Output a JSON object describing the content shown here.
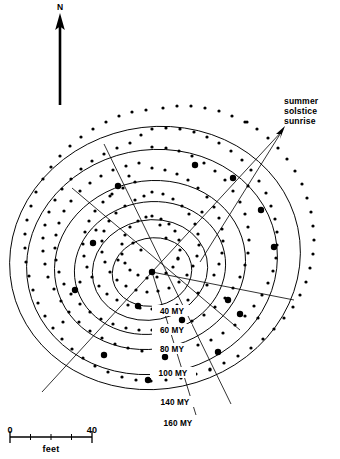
{
  "figure": {
    "background_color": "#ffffff",
    "ink_color": "#000000",
    "width": 340,
    "height": 459
  },
  "north_arrow": {
    "label": "N",
    "icon": "north-arrow-icon",
    "direction": "up",
    "tail": {
      "x": 60,
      "y": 105
    },
    "head": {
      "x": 60,
      "y": 18
    }
  },
  "annotation": {
    "icon": "arrow-pointer-icon",
    "lines": [
      "summer",
      "solstice",
      "sunrise"
    ],
    "line1": "summer",
    "line2": "solstice",
    "line3": "sunrise",
    "leader": {
      "x1": 285,
      "y1": 128,
      "x2": 197,
      "y2": 268
    }
  },
  "scale_bar": {
    "start_label": "0",
    "end_label": "40",
    "unit_label": "feet",
    "x1": 10,
    "x2": 92,
    "y": 437,
    "ticks": [
      10,
      30.5,
      51,
      71.5,
      92
    ]
  },
  "chart_data": {
    "type": "scatter",
    "xlabel": "",
    "ylabel": "",
    "center": {
      "x": 152,
      "y": 272
    },
    "ring_labels": [
      "40 MY",
      "60 MY",
      "80 MY",
      "100 MY",
      "140 MY",
      "160 MY"
    ],
    "ring_values": [
      40,
      60,
      80,
      100,
      140,
      160
    ],
    "ring_unit": "MY",
    "rings": [
      {
        "label": "40 MY",
        "value": 40,
        "rx": 40,
        "ry": 34,
        "cx": 152,
        "cy": 272,
        "rot": -12,
        "label_x": 172,
        "label_y": 313
      },
      {
        "label": "60 MY",
        "value": 60,
        "rx": 58,
        "ry": 50,
        "cx": 150,
        "cy": 270,
        "rot": -12,
        "label_x": 172,
        "label_y": 332
      },
      {
        "label": "80 MY",
        "value": 80,
        "rx": 76,
        "ry": 66,
        "cx": 150,
        "cy": 268,
        "rot": -12,
        "label_x": 172,
        "label_y": 351
      },
      {
        "label": "100 MY",
        "value": 100,
        "rx": 96,
        "ry": 84,
        "cx": 150,
        "cy": 265,
        "rot": -12,
        "label_x": 172,
        "label_y": 375
      },
      {
        "label": "140 MY",
        "value": 140,
        "rx": 126,
        "ry": 112,
        "cx": 152,
        "cy": 262,
        "rot": -12,
        "label_x": 175,
        "label_y": 404
      },
      {
        "label": "160 MY",
        "value": 160,
        "rx": 146,
        "ry": 131,
        "cx": 155,
        "cy": 258,
        "rot": -12,
        "label_x": 178,
        "label_y": 425
      }
    ],
    "alignment_lines": [
      {
        "name": "summer-solstice-sunrise",
        "x1": 152,
        "y1": 272,
        "x2": 283,
        "y2": 130
      },
      {
        "name": "solstice-back-sight",
        "x1": 152,
        "y1": 272,
        "x2": 42,
        "y2": 392
      },
      {
        "name": "cross-alignment-nw-se",
        "x1": 104,
        "y1": 144,
        "x2": 231,
        "y2": 404
      },
      {
        "name": "cross-alignment-ne-sw",
        "x1": 240,
        "y1": 330,
        "x2": 72,
        "y2": 188
      },
      {
        "name": "radial-alignment-east",
        "x1": 152,
        "y1": 272,
        "x2": 294,
        "y2": 300
      },
      {
        "name": "radial-alignment-ssw",
        "x1": 152,
        "y1": 272,
        "x2": 196,
        "y2": 415
      }
    ],
    "stones_small": [
      [
        163,
        108
      ],
      [
        177,
        106
      ],
      [
        191,
        106
      ],
      [
        205,
        108
      ],
      [
        219,
        111
      ],
      [
        232,
        116
      ],
      [
        245,
        122
      ],
      [
        257,
        129
      ],
      [
        268,
        138
      ],
      [
        278,
        148
      ],
      [
        287,
        159
      ],
      [
        295,
        171
      ],
      [
        302,
        184
      ],
      [
        307,
        198
      ],
      [
        311,
        212
      ],
      [
        313,
        226
      ],
      [
        314,
        240
      ],
      [
        313,
        254
      ],
      [
        310,
        268
      ],
      [
        306,
        282
      ],
      [
        300,
        295
      ],
      [
        293,
        307
      ],
      [
        284,
        318
      ],
      [
        274,
        329
      ],
      [
        263,
        339
      ],
      [
        251,
        348
      ],
      [
        238,
        356
      ],
      [
        224,
        363
      ],
      [
        210,
        369
      ],
      [
        196,
        374
      ],
      [
        181,
        378
      ],
      [
        166,
        380
      ],
      [
        151,
        381
      ],
      [
        136,
        380
      ],
      [
        122,
        377
      ],
      [
        108,
        372
      ],
      [
        95,
        366
      ],
      [
        83,
        358
      ],
      [
        72,
        349
      ],
      [
        62,
        339
      ],
      [
        53,
        328
      ],
      [
        45,
        316
      ],
      [
        38,
        303
      ],
      [
        33,
        290
      ],
      [
        29,
        276
      ],
      [
        26,
        262
      ],
      [
        25,
        248
      ],
      [
        25,
        234
      ],
      [
        27,
        220
      ],
      [
        31,
        206
      ],
      [
        36,
        192
      ],
      [
        43,
        179
      ],
      [
        51,
        167
      ],
      [
        60,
        156
      ],
      [
        70,
        146
      ],
      [
        81,
        137
      ],
      [
        93,
        129
      ],
      [
        106,
        122
      ],
      [
        119,
        116
      ],
      [
        132,
        112
      ],
      [
        146,
        110
      ],
      [
        152,
        129
      ],
      [
        166,
        128
      ],
      [
        180,
        129
      ],
      [
        194,
        132
      ],
      [
        207,
        137
      ],
      [
        219,
        143
      ],
      [
        231,
        151
      ],
      [
        242,
        160
      ],
      [
        251,
        170
      ],
      [
        259,
        181
      ],
      [
        266,
        193
      ],
      [
        271,
        206
      ],
      [
        275,
        219
      ],
      [
        277,
        232
      ],
      [
        277,
        245
      ],
      [
        276,
        258
      ],
      [
        273,
        271
      ],
      [
        268,
        283
      ],
      [
        262,
        295
      ],
      [
        254,
        306
      ],
      [
        245,
        316
      ],
      [
        235,
        325
      ],
      [
        223,
        333
      ],
      [
        211,
        340
      ],
      [
        198,
        345
      ],
      [
        184,
        349
      ],
      [
        170,
        351
      ],
      [
        156,
        352
      ],
      [
        142,
        351
      ],
      [
        128,
        348
      ],
      [
        115,
        344
      ],
      [
        102,
        338
      ],
      [
        90,
        331
      ],
      [
        79,
        322
      ],
      [
        69,
        312
      ],
      [
        61,
        301
      ],
      [
        54,
        289
      ],
      [
        48,
        277
      ],
      [
        45,
        264
      ],
      [
        43,
        251
      ],
      [
        43,
        238
      ],
      [
        45,
        225
      ],
      [
        49,
        212
      ],
      [
        55,
        200
      ],
      [
        62,
        189
      ],
      [
        71,
        179
      ],
      [
        81,
        169
      ],
      [
        92,
        161
      ],
      [
        104,
        154
      ],
      [
        117,
        148
      ],
      [
        130,
        143
      ],
      [
        141,
        135
      ],
      [
        152,
        147
      ],
      [
        166,
        148
      ],
      [
        179,
        151
      ],
      [
        192,
        156
      ],
      [
        204,
        163
      ],
      [
        215,
        171
      ],
      [
        225,
        180
      ],
      [
        233,
        191
      ],
      [
        240,
        202
      ],
      [
        245,
        214
      ],
      [
        248,
        227
      ],
      [
        249,
        240
      ],
      [
        248,
        253
      ],
      [
        245,
        265
      ],
      [
        240,
        277
      ],
      [
        233,
        288
      ],
      [
        225,
        298
      ],
      [
        215,
        307
      ],
      [
        204,
        315
      ],
      [
        192,
        321
      ],
      [
        179,
        326
      ],
      [
        166,
        329
      ],
      [
        152,
        330
      ],
      [
        139,
        330
      ],
      [
        126,
        328
      ],
      [
        113,
        324
      ],
      [
        101,
        319
      ],
      [
        90,
        312
      ],
      [
        80,
        304
      ],
      [
        71,
        294
      ],
      [
        64,
        284
      ],
      [
        59,
        272
      ],
      [
        56,
        260
      ],
      [
        55,
        248
      ],
      [
        56,
        235
      ],
      [
        59,
        223
      ],
      [
        64,
        211
      ],
      [
        71,
        201
      ],
      [
        80,
        191
      ],
      [
        90,
        183
      ],
      [
        101,
        176
      ],
      [
        113,
        170
      ],
      [
        126,
        166
      ],
      [
        139,
        163
      ],
      [
        152,
        168
      ],
      [
        165,
        170
      ],
      [
        177,
        174
      ],
      [
        188,
        180
      ],
      [
        198,
        188
      ],
      [
        207,
        197
      ],
      [
        214,
        207
      ],
      [
        219,
        218
      ],
      [
        222,
        229
      ],
      [
        223,
        241
      ],
      [
        222,
        253
      ],
      [
        219,
        264
      ],
      [
        214,
        275
      ],
      [
        207,
        285
      ],
      [
        198,
        293
      ],
      [
        188,
        300
      ],
      [
        177,
        305
      ],
      [
        165,
        308
      ],
      [
        152,
        309
      ],
      [
        140,
        308
      ],
      [
        128,
        305
      ],
      [
        117,
        300
      ],
      [
        107,
        294
      ],
      [
        99,
        286
      ],
      [
        92,
        277
      ],
      [
        87,
        267
      ],
      [
        84,
        256
      ],
      [
        83,
        244
      ],
      [
        85,
        232
      ],
      [
        89,
        221
      ],
      [
        95,
        211
      ],
      [
        103,
        202
      ],
      [
        112,
        194
      ],
      [
        123,
        188
      ],
      [
        135,
        182
      ],
      [
        152,
        192
      ],
      [
        163,
        194
      ],
      [
        173,
        199
      ],
      [
        182,
        206
      ],
      [
        189,
        214
      ],
      [
        195,
        224
      ],
      [
        198,
        234
      ],
      [
        199,
        245
      ],
      [
        197,
        256
      ],
      [
        193,
        266
      ],
      [
        187,
        275
      ],
      [
        179,
        282
      ],
      [
        169,
        288
      ],
      [
        158,
        291
      ],
      [
        147,
        292
      ],
      [
        136,
        290
      ],
      [
        126,
        286
      ],
      [
        117,
        280
      ],
      [
        110,
        272
      ],
      [
        105,
        262
      ],
      [
        102,
        252
      ],
      [
        102,
        241
      ],
      [
        104,
        231
      ],
      [
        109,
        221
      ],
      [
        116,
        213
      ],
      [
        125,
        206
      ],
      [
        135,
        200
      ],
      [
        144,
        196
      ],
      [
        152,
        216
      ],
      [
        161,
        219
      ],
      [
        169,
        224
      ],
      [
        175,
        231
      ],
      [
        179,
        240
      ],
      [
        180,
        250
      ],
      [
        178,
        259
      ],
      [
        173,
        267
      ],
      [
        166,
        273
      ],
      [
        157,
        277
      ],
      [
        147,
        278
      ],
      [
        138,
        275
      ],
      [
        130,
        270
      ],
      [
        125,
        263
      ],
      [
        122,
        254
      ],
      [
        122,
        244
      ],
      [
        125,
        235
      ],
      [
        130,
        227
      ],
      [
        138,
        221
      ],
      [
        146,
        217
      ],
      [
        110,
        196
      ],
      [
        129,
        176
      ],
      [
        141,
        250
      ],
      [
        166,
        238
      ],
      [
        178,
        258
      ],
      [
        133,
        243
      ],
      [
        118,
        260
      ],
      [
        160,
        225
      ],
      [
        96,
        230
      ],
      [
        202,
        212
      ],
      [
        248,
        186
      ],
      [
        80,
        282
      ],
      [
        210,
        370
      ],
      [
        258,
        318
      ],
      [
        63,
        322
      ],
      [
        247,
        122
      ]
    ],
    "stones_large": [
      [
        195,
        165
      ],
      [
        233,
        178
      ],
      [
        261,
        210
      ],
      [
        274,
        247
      ],
      [
        118,
        186
      ],
      [
        93,
        243
      ],
      [
        75,
        290
      ],
      [
        104,
        355
      ],
      [
        152,
        272
      ],
      [
        182,
        320
      ],
      [
        218,
        352
      ],
      [
        240,
        314
      ],
      [
        165,
        357
      ],
      [
        228,
        300
      ],
      [
        138,
        306
      ],
      [
        148,
        380
      ]
    ],
    "legend": "Small dots = minor stones; large dots = major stones; curved lines = stone rings; straight lines = sight alignments"
  }
}
